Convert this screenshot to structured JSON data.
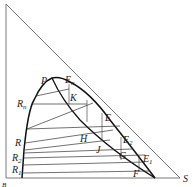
{
  "diagram": {
    "type": "ternary-extraction-diagram",
    "vertices": {
      "top": "",
      "bottom_left": "B",
      "bottom_right": "S"
    },
    "points": {
      "P": "P",
      "En": "E",
      "En_sub": "n",
      "K": "K",
      "Rn": "R",
      "Rn_sub": "n",
      "E": "E",
      "R": "R",
      "H": "H",
      "E2": "E",
      "E2_sub": "2",
      "R2": "R",
      "R2_sub": "2",
      "J": "J",
      "G": "G",
      "E1": "E",
      "E1_sub": "1",
      "R1": "R",
      "R1_sub": "1",
      "F": "F",
      "S": "S",
      "B": "B"
    },
    "colors": {
      "line": "#333333",
      "curve": "#111111",
      "background": "#ffffff"
    }
  }
}
